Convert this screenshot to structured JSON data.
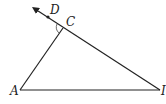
{
  "diagram": {
    "type": "geometry-triangle",
    "points": {
      "A": {
        "label": "A",
        "x": 20,
        "y": 90
      },
      "B": {
        "label": "I",
        "x": 160,
        "y": 90
      },
      "C": {
        "label": "C",
        "x": 63,
        "y": 28
      },
      "D": {
        "label": "D",
        "x": 48,
        "y": 17
      }
    },
    "segments": [
      "AC",
      "AB",
      "CB"
    ],
    "ray": {
      "from": "B",
      "through": "C",
      "extends_to": "D",
      "arrow": true
    },
    "angle_mark": {
      "vertex": "C",
      "between": [
        "A",
        "D"
      ]
    },
    "stroke_color": "#222222"
  }
}
